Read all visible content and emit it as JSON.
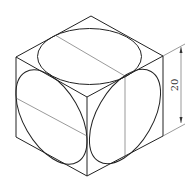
{
  "drawing": {
    "title": "Isometric cube with inscribed circles on three faces",
    "dimension": {
      "label": "20",
      "orientation": "vertical"
    },
    "colors": {
      "line": "#222222",
      "background": "#ffffff"
    }
  }
}
